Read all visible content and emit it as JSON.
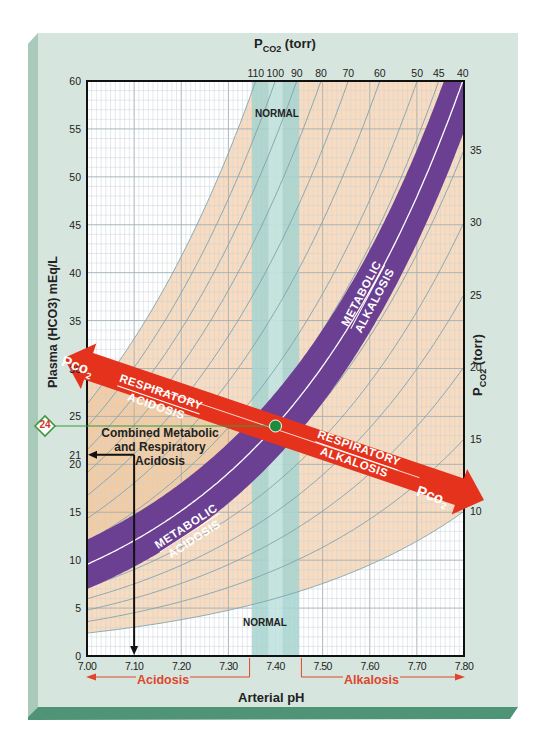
{
  "chart_data": {
    "type": "line",
    "title": "",
    "xlabel": "Arterial pH",
    "ylabel": "Plasma (HCO3-) mEq/L",
    "top_axis_label": "PCO2 (torr)",
    "right_axis_label": "PCO2 (torr)",
    "xlim": [
      7.0,
      7.8
    ],
    "ylim": [
      0,
      60
    ],
    "x_ticks": [
      "7.00",
      "7.10",
      "7.20",
      "7.30",
      "7.40",
      "7.50",
      "7.60",
      "7.70",
      "7.80"
    ],
    "y_ticks": [
      "0",
      "5",
      "10",
      "15",
      "20",
      "21",
      "24",
      "25",
      "30",
      "35",
      "40",
      "45",
      "50",
      "55",
      "60"
    ],
    "top_ticks": [
      "110",
      "100",
      "90",
      "80",
      "70",
      "60",
      "50",
      "45",
      "40"
    ],
    "right_ticks": [
      "35",
      "30",
      "25",
      "20",
      "15",
      "10"
    ],
    "grid": true,
    "isobars_pco2_torr": [
      10,
      15,
      20,
      25,
      30,
      35,
      40,
      45,
      50,
      60,
      70,
      80,
      90,
      100,
      110
    ],
    "isobar_formula": "HCO3 = 0.0301 * PCO2 * 10^(pH - 6.1)",
    "normal_range": {
      "ph_min": 7.35,
      "ph_max": 7.45,
      "label": "NORMAL"
    },
    "normal_point": {
      "ph": 7.4,
      "hco3": 24,
      "pco2": 40
    },
    "marked_values": {
      "hco3_normal": 24,
      "hco3_example": 21,
      "ph_example": 7.1
    },
    "regions": [
      {
        "name": "Respiratory Acidosis",
        "direction": "increasing PCO2, lower pH"
      },
      {
        "name": "Respiratory Alkalosis",
        "direction": "decreasing PCO2, higher pH"
      },
      {
        "name": "Metabolic Acidosis",
        "direction": "along PCO2 40 isobar, lower HCO3"
      },
      {
        "name": "Metabolic Alkalosis",
        "direction": "along PCO2 40 isobar, higher HCO3"
      },
      {
        "name": "Combined Metabolic and Respiratory Acidosis",
        "example": {
          "ph": 7.1,
          "hco3": 21
        }
      }
    ],
    "bottom_legend": [
      "Acidosis",
      "Alkalosis"
    ]
  },
  "labels": {
    "top_axis": "P",
    "top_axis_sub": "CO2",
    "top_axis_unit": " (torr)",
    "right_axis": "P",
    "right_axis_sub": "CO2",
    "right_axis_unit": " (torr)",
    "left_axis": "Plasma (HCO3) mEq/L",
    "x_axis": "Arterial pH",
    "normal_top": "NORMAL",
    "normal_bottom": "NORMAL",
    "resp_acidosis_1": "RESPIRATORY",
    "resp_acidosis_2": "ACIDOSIS",
    "resp_alkalosis_1": "RESPIRATORY",
    "resp_alkalosis_2": "ALKALOSIS",
    "pco2_arrow": "Pco",
    "pco2_arrow_sub": "2",
    "met_alk_1": "METABOLIC",
    "met_alk_2": "ALKALOSIS",
    "met_acid_1": "METABOLIC",
    "met_acid_2": "ACIDOSIS",
    "combined_1": "Combined Metabolic",
    "combined_2": "and Respiratory",
    "combined_3": "Acidosis",
    "diamond_value": "24",
    "acidosis": "Acidosis",
    "alkalosis": "Alkalosis"
  },
  "colors": {
    "frame": "#d6e6df",
    "frame_edge": "#a9c9bb",
    "bevel": "#4f9477",
    "grid_minor": "#c9d3d8",
    "grid_major": "#9fb0b8",
    "peach": "#f9dcc0",
    "peach_dark": "#f2c79a",
    "normal_band": "#a6d3d0",
    "purple": "#6b3f92",
    "red_arrow": "#e5321d",
    "isobar": "#7fa3ad",
    "green_line": "#3a9a3a",
    "green_dot": "#1f8a3c",
    "bottom_red": "#e0452b"
  }
}
